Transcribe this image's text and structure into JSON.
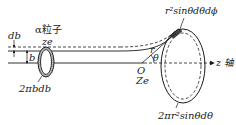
{
  "diagram": {
    "type": "rutherford-scattering-geometry",
    "labels": {
      "db": "db",
      "b": "b",
      "alpha_particle": "α粒子",
      "alpha_charge": "ze",
      "ring_area": "2πbdb",
      "solid_angle_element": "r²sinθdθdϕ",
      "nucleus_point": "O",
      "nucleus_charge": "Ze",
      "radius": "r",
      "angle": "θ",
      "axis": "z 轴",
      "annulus_area": "2πr²sinθdθ"
    },
    "colors": {
      "line": "#1a1a1a",
      "background": "#ffffff"
    }
  }
}
